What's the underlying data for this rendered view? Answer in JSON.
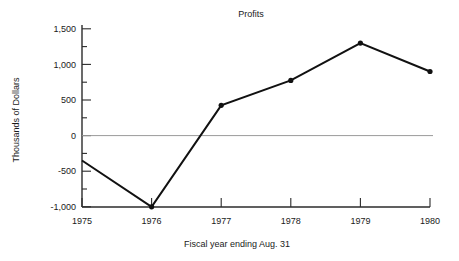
{
  "chart_data": {
    "type": "line",
    "title": "Profits",
    "xlabel": "Fiscal year ending Aug. 31",
    "ylabel": "Thousands of Dollars",
    "categories": [
      "1975",
      "1976",
      "1977",
      "1978",
      "1979",
      "1980"
    ],
    "x": [
      1975,
      1976,
      1977,
      1978,
      1979,
      1980
    ],
    "values": [
      -350,
      -1000,
      425,
      775,
      1300,
      900
    ],
    "series": [
      {
        "name": "Profits",
        "values": [
          -350,
          -1000,
          425,
          775,
          1300,
          900
        ]
      }
    ],
    "ylim": [
      -1000,
      1500
    ],
    "xlim": [
      1975,
      1980
    ],
    "ytick_labels": [
      "1,500",
      "1,000",
      "500",
      "0",
      "-500",
      "-1,000"
    ],
    "ytick_values": [
      1500,
      1000,
      500,
      0,
      -500,
      -1000
    ],
    "yminor_step": 250,
    "xtick_labels": [
      "1975",
      "1976",
      "1977",
      "1978",
      "1979",
      "1980"
    ],
    "grid": false,
    "zero_line": true,
    "legend": null,
    "marker": "filled-circle",
    "line_color": "#111111",
    "zero_line_color": "#9a9a9a"
  },
  "ticks": {
    "y": [
      {
        "label": "1,500",
        "value": 1500
      },
      {
        "label": "1,000",
        "value": 1000
      },
      {
        "label": "500",
        "value": 500
      },
      {
        "label": "0",
        "value": 0
      },
      {
        "label": "-500",
        "value": -500
      },
      {
        "label": "-1,000",
        "value": -1000
      }
    ],
    "x": [
      {
        "label": "1975"
      },
      {
        "label": "1976"
      },
      {
        "label": "1977"
      },
      {
        "label": "1978"
      },
      {
        "label": "1979"
      },
      {
        "label": "1980"
      }
    ]
  },
  "labels": {
    "title": "Profits",
    "y_axis_title": "Thousands of Dollars",
    "x_axis_title": "Fiscal year ending Aug. 31",
    "ytick_0": "1,500",
    "ytick_1": "1,000",
    "ytick_2": "500",
    "ytick_3": "0",
    "ytick_4": "-500",
    "ytick_5": "-1,000",
    "xtick_0": "1975",
    "xtick_1": "1976",
    "xtick_2": "1977",
    "xtick_3": "1978",
    "xtick_4": "1979",
    "xtick_5": "1980"
  }
}
